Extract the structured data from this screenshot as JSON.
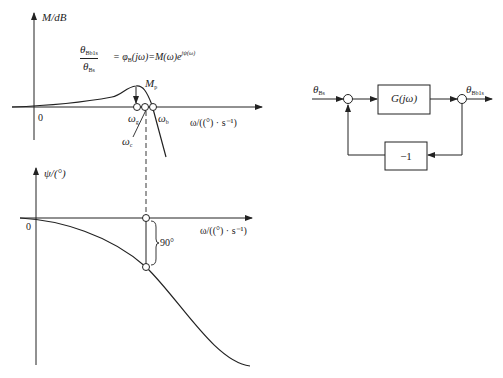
{
  "magnitude_plot": {
    "y_axis_label": "M/dB",
    "x_axis_label": "ω/((°) · s⁻¹)",
    "origin_label": "0",
    "peak_label": {
      "symbol": "M",
      "subscript": "p"
    },
    "points": {
      "omega_g": {
        "symbol": "ω",
        "subscript": "g"
      },
      "omega_c": {
        "symbol": "ω",
        "subscript": "c"
      },
      "omega_b": {
        "symbol": "ω",
        "subscript": "b"
      }
    },
    "equation": {
      "numerator": {
        "symbol": "θ",
        "subscript": "Bb1s"
      },
      "denominator": {
        "symbol": "θ",
        "subscript": "Bs"
      },
      "rhs_part1": "= φ",
      "rhs_sub": "B",
      "rhs_part2": "(jω)=M(ω)e",
      "rhs_sup": "jψ(ω)"
    }
  },
  "phase_plot": {
    "y_axis_label": "ψ/(°)",
    "x_axis_label": "ω/((°) · s⁻¹)",
    "origin_label": "0",
    "phase_margin_label": "90°"
  },
  "block_diagram": {
    "input": {
      "symbol": "θ",
      "subscript": "Bs"
    },
    "output": {
      "symbol": "θ",
      "subscript": "Bb1s"
    },
    "forward_block": "G(jω)",
    "feedback_block": "−1"
  },
  "colors": {
    "line": "#222222",
    "background": "#ffffff"
  }
}
